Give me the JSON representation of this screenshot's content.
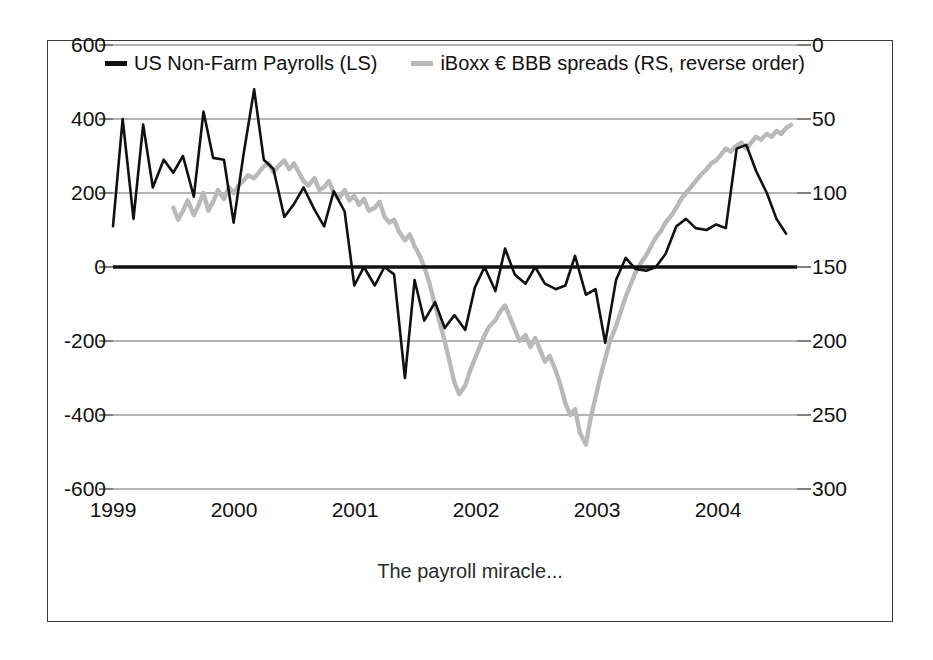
{
  "figure": {
    "caption": "The payroll miracle...",
    "frame_color": "#3a3a3a",
    "background": "#ffffff"
  },
  "legend": {
    "position": "top-center",
    "items": [
      {
        "label": "US Non-Farm Payrolls (LS)",
        "color": "#111111",
        "swatch": "black"
      },
      {
        "label": "iBoxx € BBB spreads (RS, reverse order)",
        "color": "#b9b9b9",
        "swatch": "gray"
      }
    ]
  },
  "axes": {
    "left_ticks": [
      "600",
      "400",
      "200",
      "0",
      "-200",
      "-400",
      "-600"
    ],
    "right_ticks": [
      "0",
      "50",
      "100",
      "150",
      "200",
      "250",
      "300"
    ],
    "x_ticks": [
      "1999",
      "2000",
      "2001",
      "2002",
      "2003",
      "2004"
    ]
  },
  "chart_data": {
    "type": "line",
    "title": "",
    "subtitle": "",
    "xlabel": "",
    "ylabel": "",
    "y2label": "",
    "annotations": [
      "The payroll miracle..."
    ],
    "grid": true,
    "legend_position": "top-center",
    "x": "monthly, 1999-01 to 2004-08",
    "xlim": [
      1999.0,
      2004.67
    ],
    "xticks": [
      1999,
      2000,
      2001,
      2002,
      2003,
      2004
    ],
    "xticklabels": [
      "1999",
      "2000",
      "2001",
      "2002",
      "2003",
      "2004"
    ],
    "ylim": [
      -600,
      600
    ],
    "yticks": [
      -600,
      -400,
      -200,
      0,
      200,
      400,
      600
    ],
    "yticklabels": [
      "-600",
      "-400",
      "-200",
      "0",
      "200",
      "400",
      "600"
    ],
    "y2lim": [
      300,
      0
    ],
    "y2ticks": [
      0,
      50,
      100,
      150,
      200,
      250,
      300
    ],
    "y2ticklabels": [
      "0",
      "50",
      "100",
      "150",
      "200",
      "250",
      "300"
    ],
    "y2_reversed": true,
    "zero_line": 0,
    "series": [
      {
        "name": "US Non-Farm Payrolls (LS)",
        "axis": "left",
        "color": "#111111",
        "units": "thousands of jobs, monthly change",
        "x": [
          1999.0,
          1999.08,
          1999.17,
          1999.25,
          1999.33,
          1999.42,
          1999.5,
          1999.58,
          1999.67,
          1999.75,
          1999.83,
          1999.92,
          2000.0,
          2000.08,
          2000.17,
          2000.25,
          2000.33,
          2000.42,
          2000.5,
          2000.58,
          2000.67,
          2000.75,
          2000.83,
          2000.92,
          2001.0,
          2001.08,
          2001.17,
          2001.25,
          2001.33,
          2001.42,
          2001.5,
          2001.58,
          2001.67,
          2001.75,
          2001.83,
          2001.92,
          2002.0,
          2002.08,
          2002.17,
          2002.25,
          2002.33,
          2002.42,
          2002.5,
          2002.58,
          2002.67,
          2002.75,
          2002.83,
          2002.92,
          2003.0,
          2003.08,
          2003.17,
          2003.25,
          2003.33,
          2003.42,
          2003.5,
          2003.58,
          2003.67,
          2003.75,
          2003.83,
          2003.92,
          2004.0,
          2004.08,
          2004.17,
          2004.25,
          2004.33,
          2004.42,
          2004.5,
          2004.58
        ],
        "values": [
          110,
          400,
          130,
          385,
          215,
          290,
          255,
          300,
          190,
          420,
          295,
          290,
          120,
          300,
          480,
          290,
          265,
          135,
          170,
          215,
          155,
          110,
          205,
          150,
          -50,
          0,
          -50,
          0,
          -20,
          -300,
          -35,
          -145,
          -95,
          -165,
          -130,
          -170,
          -55,
          0,
          -65,
          50,
          -20,
          -45,
          0,
          -45,
          -60,
          -50,
          30,
          -75,
          -60,
          -205,
          -35,
          25,
          -5,
          -10,
          0,
          35,
          110,
          130,
          105,
          100,
          115,
          105,
          320,
          330,
          260,
          200,
          130,
          90
        ]
      },
      {
        "name": "iBoxx € BBB spreads (RS, reverse order)",
        "axis": "right",
        "color": "#b9b9b9",
        "units": "basis points, plotted on inverted right axis",
        "x": [
          1999.5,
          1999.54,
          1999.58,
          1999.62,
          1999.67,
          1999.71,
          1999.75,
          1999.79,
          1999.83,
          1999.87,
          1999.92,
          1999.96,
          2000.0,
          2000.04,
          2000.08,
          2000.12,
          2000.17,
          2000.21,
          2000.25,
          2000.29,
          2000.33,
          2000.37,
          2000.42,
          2000.46,
          2000.5,
          2000.54,
          2000.58,
          2000.62,
          2000.67,
          2000.71,
          2000.75,
          2000.79,
          2000.83,
          2000.87,
          2000.92,
          2000.96,
          2001.0,
          2001.04,
          2001.08,
          2001.12,
          2001.17,
          2001.21,
          2001.25,
          2001.29,
          2001.33,
          2001.37,
          2001.42,
          2001.46,
          2001.5,
          2001.54,
          2001.58,
          2001.62,
          2001.67,
          2001.71,
          2001.75,
          2001.79,
          2001.83,
          2001.87,
          2001.92,
          2001.96,
          2002.0,
          2002.04,
          2002.08,
          2002.12,
          2002.17,
          2002.21,
          2002.25,
          2002.29,
          2002.33,
          2002.37,
          2002.42,
          2002.46,
          2002.5,
          2002.54,
          2002.58,
          2002.62,
          2002.67,
          2002.71,
          2002.75,
          2002.79,
          2002.83,
          2002.87,
          2002.92,
          2002.96,
          2003.0,
          2003.04,
          2003.08,
          2003.12,
          2003.17,
          2003.21,
          2003.25,
          2003.29,
          2003.33,
          2003.37,
          2003.42,
          2003.46,
          2003.5,
          2003.54,
          2003.58,
          2003.62,
          2003.67,
          2003.71,
          2003.75,
          2003.79,
          2003.83,
          2003.87,
          2003.92,
          2003.96,
          2004.0,
          2004.04,
          2004.08,
          2004.12,
          2004.17,
          2004.21,
          2004.25,
          2004.29,
          2004.33,
          2004.37,
          2004.42,
          2004.46,
          2004.5,
          2004.54,
          2004.58,
          2004.62
        ],
        "values_bp": [
          110,
          118,
          112,
          105,
          115,
          108,
          100,
          112,
          106,
          98,
          104,
          96,
          100,
          95,
          92,
          88,
          90,
          86,
          82,
          80,
          86,
          82,
          78,
          84,
          80,
          86,
          92,
          95,
          90,
          98,
          96,
          92,
          100,
          104,
          98,
          105,
          102,
          108,
          104,
          112,
          110,
          106,
          116,
          120,
          118,
          126,
          132,
          128,
          136,
          142,
          150,
          160,
          176,
          188,
          200,
          214,
          228,
          236,
          230,
          220,
          212,
          204,
          196,
          190,
          186,
          180,
          176,
          184,
          192,
          200,
          196,
          204,
          198,
          206,
          214,
          210,
          220,
          230,
          242,
          250,
          246,
          262,
          270,
          252,
          238,
          224,
          212,
          200,
          190,
          180,
          170,
          162,
          154,
          148,
          142,
          136,
          130,
          126,
          120,
          116,
          110,
          104,
          100,
          96,
          92,
          88,
          84,
          80,
          78,
          74,
          70,
          72,
          68,
          66,
          70,
          66,
          62,
          64,
          60,
          62,
          58,
          60,
          56,
          54
        ]
      }
    ]
  }
}
